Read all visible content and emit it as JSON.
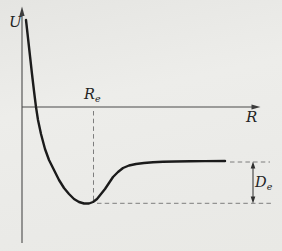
{
  "figure": {
    "labels": {
      "y_axis": "U",
      "x_axis": "R",
      "equilibrium": {
        "base": "R",
        "sub": "e"
      },
      "well_depth": {
        "base": "D",
        "sub": "e"
      }
    },
    "colors": {
      "background": "#ebebe8",
      "curve": "#1b1b1b",
      "axis": "#4a4a4a",
      "dashed": "#7d7d7d",
      "text": "#242424"
    }
  },
  "chart_data": {
    "type": "line",
    "xlabel": "R",
    "ylabel": "U",
    "grid": false,
    "legend": [],
    "annotations": [
      {
        "label": "Re",
        "role": "dashed vertical line marking R value of the curve minimum"
      },
      {
        "label": "De",
        "role": "double-headed arrow between dashed lines marking depth from large-R asymptote to curve minimum"
      }
    ],
    "curve_px": [
      [
        26,
        20
      ],
      [
        28,
        38
      ],
      [
        30,
        56
      ],
      [
        32,
        74
      ],
      [
        34,
        91
      ],
      [
        36,
        107
      ],
      [
        38,
        120
      ],
      [
        41,
        134
      ],
      [
        45,
        149
      ],
      [
        49,
        160
      ],
      [
        54,
        170
      ],
      [
        59,
        180
      ],
      [
        64,
        188
      ],
      [
        69,
        194
      ],
      [
        74,
        199
      ],
      [
        79,
        202
      ],
      [
        84,
        203.5
      ],
      [
        89,
        203.5
      ],
      [
        93,
        202
      ],
      [
        97,
        199
      ],
      [
        101,
        194
      ],
      [
        105,
        189
      ],
      [
        109,
        183
      ],
      [
        113,
        177
      ],
      [
        118,
        172
      ],
      [
        123,
        168
      ],
      [
        129,
        165.5
      ],
      [
        136,
        164
      ],
      [
        144,
        163
      ],
      [
        153,
        162.2
      ],
      [
        163,
        161.8
      ],
      [
        175,
        161.5
      ],
      [
        190,
        161.3
      ],
      [
        205,
        161.1
      ],
      [
        225,
        161
      ]
    ]
  }
}
